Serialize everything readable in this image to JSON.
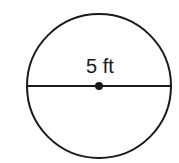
{
  "diagram": {
    "shape": "circle",
    "label": "5 ft",
    "measurement": "diameter",
    "value": 5,
    "unit": "ft",
    "colors": {
      "stroke": "#1a1a1a",
      "background": "#ffffff"
    }
  }
}
